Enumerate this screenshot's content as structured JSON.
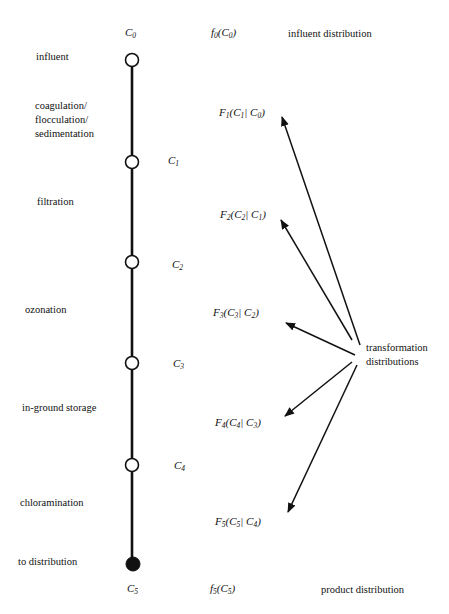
{
  "title_nodes": {
    "top": {
      "symbol": "C",
      "sub": "0",
      "dist_f": "f",
      "dist_sub": "0",
      "dist_arg": "C",
      "dist_arg_sub": "0",
      "desc": "influent distribution"
    },
    "bottom": {
      "symbol": "C",
      "sub": "5",
      "dist_f": "f",
      "dist_sub": "5",
      "dist_arg": "C",
      "dist_arg_sub": "5",
      "desc": "product distribution"
    }
  },
  "stages": [
    {
      "label": "influent"
    },
    {
      "label": "coagulation/\nflocculation/\nsedimentation"
    },
    {
      "label": "filtration"
    },
    {
      "label": "ozonation"
    },
    {
      "label": "in-ground storage"
    },
    {
      "label": "chloramination"
    },
    {
      "label": "to distribution"
    }
  ],
  "nodes": [
    {
      "sym": "C",
      "sub": "1"
    },
    {
      "sym": "C",
      "sub": "2"
    },
    {
      "sym": "C",
      "sub": "3"
    },
    {
      "sym": "C",
      "sub": "4"
    }
  ],
  "transforms": [
    {
      "F": "F",
      "i": "1",
      "a": "C",
      "ai": "1",
      "b": "C",
      "bi": "0"
    },
    {
      "F": "F",
      "i": "2",
      "a": "C",
      "ai": "2",
      "b": "C",
      "bi": "1"
    },
    {
      "F": "F",
      "i": "3",
      "a": "C",
      "ai": "3",
      "b": "C",
      "bi": "2"
    },
    {
      "F": "F",
      "i": "4",
      "a": "C",
      "ai": "4",
      "b": "C",
      "bi": "3"
    },
    {
      "F": "F",
      "i": "5",
      "a": "C",
      "ai": "5",
      "b": "C",
      "bi": "4"
    }
  ],
  "transform_label": "transformation\ndistributions",
  "colors": {
    "line": "#111111",
    "background": "#ffffff"
  }
}
